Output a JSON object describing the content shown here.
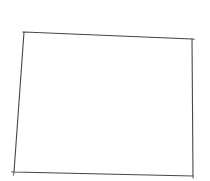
{
  "canvas": {
    "width": 210,
    "height": 181,
    "background": "#ffffff"
  },
  "figure": {
    "name": "state-outline",
    "stroke_color": "#474747",
    "stroke_width": "1.1",
    "fill": "none",
    "outline_points": "24,32 192,39 193,176 14,172",
    "corner_overshoots_path": "M 22.2 32.3 L 24.2 32 M 191.8 39 L 194.7 39.4 M 14.2 171.6 L 13.2 175.7 M 11.3 171.9 L 14.4 172 M 193 175.6 L 193.2 178.5"
  }
}
